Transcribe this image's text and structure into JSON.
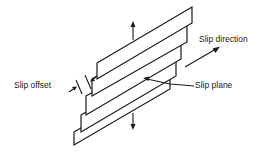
{
  "diagram": {
    "labels": {
      "slip_direction": "Slip direction",
      "slip_plane": "Slip plane",
      "slip_offset": "Slip offset"
    },
    "slab_count": 5,
    "colors": {
      "stroke": "#1a1a1a",
      "background": "#ffffff"
    }
  }
}
